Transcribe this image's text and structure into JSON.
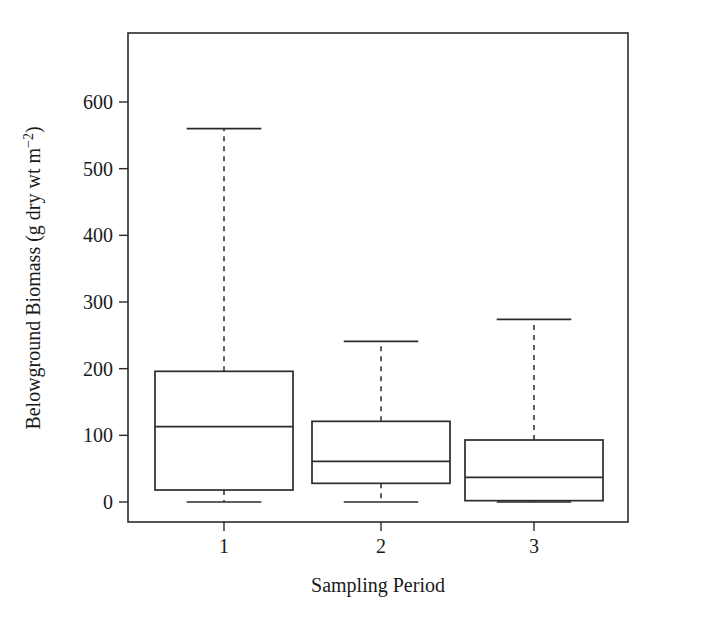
{
  "figure": {
    "background_color": "#ffffff",
    "line_color": "#2b2b2b"
  },
  "chart_data": {
    "type": "box",
    "title": "",
    "subtitle": "",
    "xlabel": "Sampling Period",
    "ylabel": "Belowground Biomass (g dry wt m−2)",
    "ylabel_parts": {
      "main": "Belowground Biomass (g dry wt m",
      "superscript": "−2",
      "closing": ")"
    },
    "categories": [
      "1",
      "2",
      "3"
    ],
    "xtick_labels": [
      "1",
      "2",
      "3"
    ],
    "ytick_labels": [
      "0",
      "100",
      "200",
      "300",
      "400",
      "500",
      "600"
    ],
    "ytick_values": [
      0,
      100,
      200,
      300,
      400,
      500,
      600
    ],
    "ylim": [
      -25,
      660
    ],
    "xlim": [
      0.35,
      3.65
    ],
    "grid": false,
    "legend": null,
    "whisker_style": "dashed",
    "boxes": [
      {
        "category": "1",
        "lower_whisker": 0,
        "q1": 18,
        "median": 113,
        "q3": 196,
        "upper_whisker": 560
      },
      {
        "category": "2",
        "lower_whisker": 0,
        "q1": 28,
        "median": 61,
        "q3": 121,
        "upper_whisker": 241
      },
      {
        "category": "3",
        "lower_whisker": 0,
        "q1": 2,
        "median": 37,
        "q3": 93,
        "upper_whisker": 274
      }
    ]
  }
}
